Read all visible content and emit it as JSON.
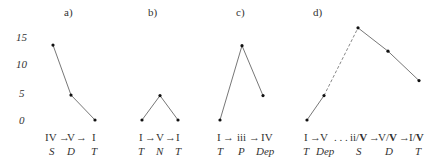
{
  "chart_data": [
    {
      "type": "line",
      "title": "a)",
      "yticks": [
        "15",
        "10",
        "5",
        "0"
      ],
      "ylim": [
        0,
        15
      ],
      "points": [
        {
          "chord": "IV",
          "function": "S",
          "value": 13.5
        },
        {
          "chord": "V",
          "function": "D",
          "value": 4.5
        },
        {
          "chord": "I",
          "function": "T",
          "value": 0
        }
      ],
      "chord_label": "IV→V→I",
      "segments": [
        {
          "from": 0,
          "to": 1,
          "style": "solid"
        },
        {
          "from": 1,
          "to": 2,
          "style": "solid"
        }
      ]
    },
    {
      "type": "line",
      "title": "b)",
      "points": [
        {
          "chord": "I",
          "function": "T",
          "value": 0
        },
        {
          "chord": "V",
          "function": "N",
          "value": 4.4
        },
        {
          "chord": "I",
          "function": "T",
          "value": 0
        }
      ],
      "chord_label": "I→V→I",
      "segments": [
        {
          "from": 0,
          "to": 1,
          "style": "solid"
        },
        {
          "from": 1,
          "to": 2,
          "style": "solid"
        }
      ]
    },
    {
      "type": "line",
      "title": "c)",
      "points": [
        {
          "chord": "I",
          "function": "T",
          "value": 0
        },
        {
          "chord": "iii",
          "function": "P",
          "value": 13.4
        },
        {
          "chord": "IV",
          "function": "Dep",
          "value": 4.4
        }
      ],
      "chord_label": "I→iii→IV",
      "segments": [
        {
          "from": 0,
          "to": 1,
          "style": "solid"
        },
        {
          "from": 1,
          "to": 2,
          "style": "solid"
        }
      ]
    },
    {
      "type": "line",
      "title": "d)",
      "points": [
        {
          "chord": "I",
          "function": "T",
          "value": 0
        },
        {
          "chord": "V",
          "function": "Dep",
          "value": 4.4
        },
        {
          "chord": "ii/V",
          "function": "S",
          "value": 16.6
        },
        {
          "chord": "V/V",
          "function": "D",
          "value": 12.4
        },
        {
          "chord": "I/V",
          "function": "T",
          "value": 7.1
        }
      ],
      "chord_label": "I→V ... ii/V→V/V→I/V",
      "segments": [
        {
          "from": 0,
          "to": 1,
          "style": "solid"
        },
        {
          "from": 1,
          "to": 2,
          "style": "dashed"
        },
        {
          "from": 2,
          "to": 3,
          "style": "solid"
        },
        {
          "from": 3,
          "to": 4,
          "style": "solid"
        }
      ]
    }
  ]
}
